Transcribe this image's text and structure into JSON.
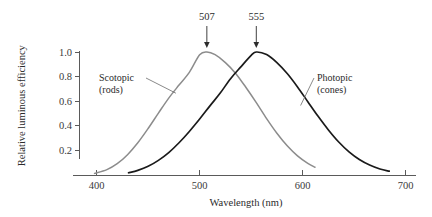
{
  "chart_data": {
    "type": "line",
    "title": "",
    "xlabel": "Wavelength (nm)",
    "ylabel": "Relative luminous efficiency",
    "xlim": [
      380,
      710
    ],
    "ylim": [
      0.0,
      1.08
    ],
    "grid": false,
    "legend_position": "inline-labels",
    "xticks": [
      "400",
      "500",
      "600",
      "700"
    ],
    "xtick_values": [
      400,
      500,
      600,
      700
    ],
    "yticks": [
      "0.2",
      "0.4",
      "0.6",
      "0.8",
      "1.0"
    ],
    "ytick_values": [
      0.2,
      0.4,
      0.6,
      0.8,
      1.0
    ],
    "series": [
      {
        "name": "Scotopic (rods)",
        "label_line1": "Scotopic",
        "label_line2": "(rods)",
        "color": "#8c8c8c",
        "peak_nm": 507,
        "peak_label": "507",
        "sigma_nm": 46,
        "x_start": 398,
        "x_end": 612,
        "x": [
          398,
          410,
          420,
          430,
          440,
          450,
          460,
          470,
          480,
          490,
          500,
          507,
          515,
          525,
          535,
          545,
          555,
          565,
          575,
          585,
          595,
          605,
          612
        ],
        "values": [
          0.013,
          0.044,
          0.092,
          0.165,
          0.262,
          0.378,
          0.503,
          0.625,
          0.731,
          0.834,
          0.977,
          1.0,
          0.978,
          0.914,
          0.826,
          0.711,
          0.588,
          0.458,
          0.339,
          0.237,
          0.155,
          0.094,
          0.063
        ]
      },
      {
        "name": "Photopic (cones)",
        "label_line1": "Photopic",
        "label_line2": "(cones)",
        "color": "#1a1a1a",
        "peak_nm": 555,
        "peak_label": "555",
        "sigma_nm": 48,
        "x_start": 431,
        "x_end": 684,
        "x": [
          431,
          440,
          450,
          460,
          470,
          480,
          490,
          500,
          510,
          520,
          530,
          540,
          550,
          555,
          565,
          575,
          585,
          595,
          605,
          615,
          625,
          635,
          645,
          655,
          665,
          675,
          684
        ],
        "values": [
          0.018,
          0.038,
          0.071,
          0.119,
          0.182,
          0.262,
          0.354,
          0.455,
          0.562,
          0.666,
          0.783,
          0.879,
          0.972,
          1.0,
          0.979,
          0.914,
          0.825,
          0.716,
          0.596,
          0.477,
          0.366,
          0.268,
          0.188,
          0.126,
          0.081,
          0.049,
          0.031
        ]
      }
    ],
    "annotations": [
      {
        "text": "507",
        "x_nm": 507,
        "kind": "arrow-down"
      },
      {
        "text": "555",
        "x_nm": 555,
        "kind": "arrow-down"
      }
    ]
  }
}
